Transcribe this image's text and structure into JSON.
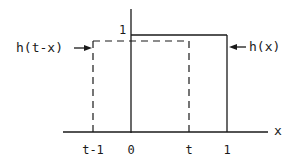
{
  "diagram": {
    "title": "",
    "curves": {
      "h_x": {
        "label": "h(x)",
        "style": "solid",
        "x_from": "0",
        "x_to": "1",
        "height": "1"
      },
      "h_t_minus_x": {
        "label": "h(t-x)",
        "style": "dashed",
        "x_from": "t-1",
        "x_to": "t"
      }
    },
    "axis": {
      "x_label": "x",
      "y_tick_label": "1",
      "x_ticks": [
        "t-1",
        "0",
        "t",
        "1"
      ]
    },
    "colors": {
      "ink": "#1a1a1a",
      "background": "#ffffff"
    }
  }
}
